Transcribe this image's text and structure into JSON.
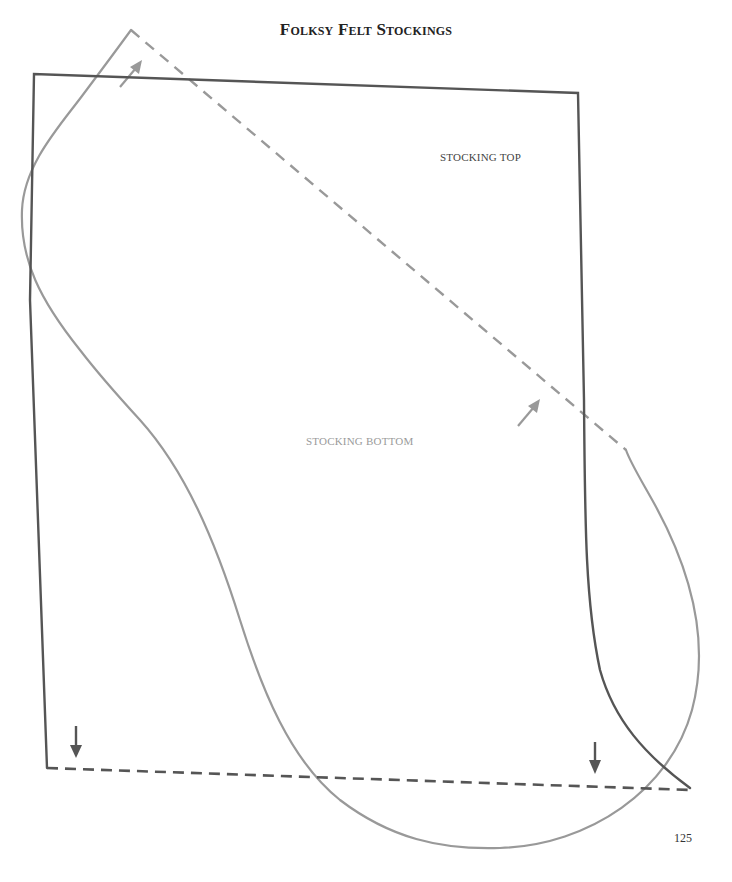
{
  "page": {
    "title": "Folksy Felt Stockings",
    "page_number": "125"
  },
  "pattern": {
    "pieces": [
      {
        "name": "stocking-top",
        "label": "Stocking Top",
        "line_color": "#555555"
      },
      {
        "name": "stocking-bottom",
        "label": "Stocking Bottom",
        "line_color": "#999999"
      }
    ],
    "fold_line_color_dark": "#555555",
    "fold_line_color_light": "#999999",
    "grain_arrow_color_dark": "#555555",
    "grain_arrow_color_light": "#999999"
  }
}
